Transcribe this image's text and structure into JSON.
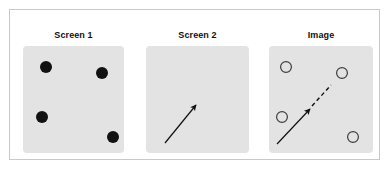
{
  "figure": {
    "background_color": "#ffffff",
    "frame_color": "#c9c9c9",
    "panel_fill_color": "#e3e3e3",
    "marker_fill_color": "#111111",
    "marker_outline_color": "#3c3c3c",
    "arrow_color": "#111111"
  },
  "panels": [
    {
      "id": "screen1",
      "title": "Screen 1",
      "marker_style": "filled-dot",
      "markers": [
        {
          "cx": 23,
          "cy": 21,
          "r": 6
        },
        {
          "cx": 79,
          "cy": 27,
          "r": 6
        },
        {
          "cx": 19,
          "cy": 71,
          "r": 6
        },
        {
          "cx": 90,
          "cy": 91,
          "r": 6
        }
      ],
      "arrows": []
    },
    {
      "id": "screen2",
      "title": "Screen 2",
      "marker_style": "none",
      "markers": [],
      "arrows": [
        {
          "type": "solid",
          "x1": 19,
          "y1": 97,
          "x2": 50,
          "y2": 59
        }
      ]
    },
    {
      "id": "image",
      "title": "Image",
      "marker_style": "hollow-circle",
      "markers": [
        {
          "cx": 17,
          "cy": 21,
          "r": 6
        },
        {
          "cx": 73,
          "cy": 27,
          "r": 6
        },
        {
          "cx": 13,
          "cy": 71,
          "r": 6
        },
        {
          "cx": 84,
          "cy": 91,
          "r": 6
        }
      ],
      "arrows": [
        {
          "type": "solid",
          "x1": 8,
          "y1": 98,
          "x2": 41,
          "y2": 63
        },
        {
          "type": "dashed",
          "x1": 43,
          "y1": 60,
          "x2": 62,
          "y2": 39
        }
      ]
    }
  ]
}
